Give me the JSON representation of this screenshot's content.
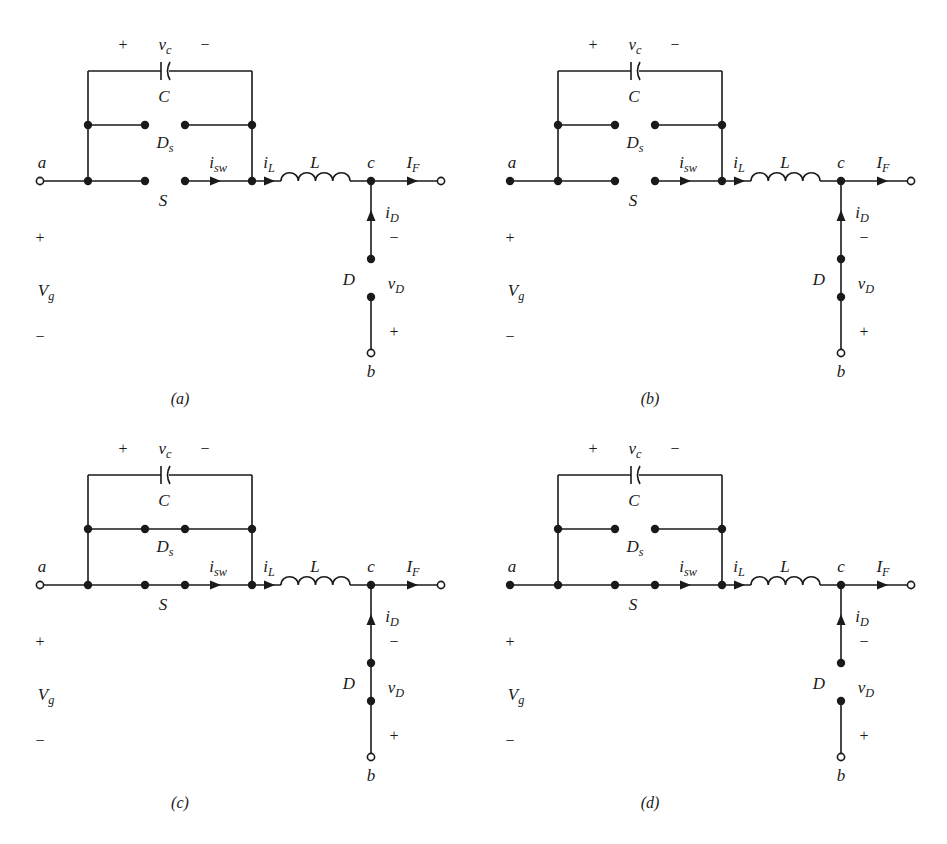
{
  "figure": {
    "panels": [
      {
        "id": "a",
        "caption": "(a)",
        "offset": [
          0,
          0
        ],
        "terminal_a_filled": false,
        "switch_S_closed": false,
        "diode_Ds_closed": false,
        "diode_D_closed": false
      },
      {
        "id": "b",
        "caption": "(b)",
        "offset": [
          470,
          0
        ],
        "terminal_a_filled": true,
        "switch_S_closed": false,
        "diode_Ds_closed": false,
        "diode_D_closed": true
      },
      {
        "id": "c",
        "caption": "(c)",
        "offset": [
          0,
          420
        ],
        "terminal_a_filled": false,
        "switch_S_closed": true,
        "diode_Ds_closed": true,
        "diode_D_closed": true
      },
      {
        "id": "d",
        "caption": "(d)",
        "offset": [
          470,
          420
        ],
        "terminal_a_filled": true,
        "switch_S_closed": true,
        "diode_Ds_closed": false,
        "diode_D_closed": false
      }
    ],
    "labels": {
      "node_a": "a",
      "node_b": "b",
      "node_c": "c",
      "vc": "v",
      "vc_sub": "c",
      "vc_plus": "+",
      "vc_minus": "−",
      "capacitor": "C",
      "diode_s": "D",
      "diode_s_sub": "s",
      "switch": "S",
      "i_sw": "i",
      "i_sw_sub": "sw",
      "i_L": "i",
      "i_L_sub": "L",
      "inductor": "L",
      "I_F": "I",
      "I_F_sub": "F",
      "i_D": "i",
      "i_D_sub": "D",
      "diode": "D",
      "v_D": "v",
      "v_D_sub": "D",
      "vD_minus": "−",
      "vD_plus": "+",
      "vg_plus": "+",
      "vg": "V",
      "vg_sub": "g",
      "vg_minus": "−"
    }
  }
}
